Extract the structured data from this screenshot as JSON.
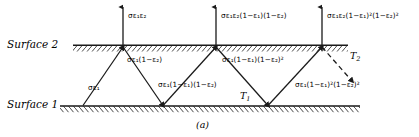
{
  "figure": {
    "caption": "(a)",
    "surfaces": [
      {
        "name": "Surface 2",
        "temperature": "T",
        "temperature_sub": "2"
      },
      {
        "name": "Surface 1",
        "temperature": "T",
        "temperature_sub": "1"
      }
    ]
  },
  "emitted_rays": [
    {
      "id": "emitted-1",
      "prefix": "σε",
      "s1": "1",
      "mid": "ε",
      "s2": "2",
      "tail": ""
    },
    {
      "id": "emitted-2",
      "prefix": "σε",
      "s1": "1",
      "mid": "ε",
      "s2": "2",
      "tail": "(1−ε₁)(1−ε₂)"
    },
    {
      "id": "emitted-3",
      "prefix": "σε",
      "s1": "1",
      "mid": "ε",
      "s2": "2",
      "tail": "(1−ε₁)²(1−ε₂)²"
    }
  ],
  "labels": {
    "top_1": "σε₁ε₂",
    "top_2": "σε₁ε₂(1−ε₁)(1−ε₂)",
    "top_3": "σε₁ε₂(1−ε₁)²(1−ε₂)²",
    "mid_1": "σε₁(1−ε₂)",
    "mid_2": "σε₁(1−ε₁)(1−ε₂)²",
    "low_1": "σε₁",
    "low_2": "σε₁(1−ε₁)(1−ε₂)",
    "low_3": "σε₁(1−ε₁)²(1−ε₂)²",
    "surface_2": "Surface 2",
    "surface_1": "Surface 1",
    "T2": "T",
    "T2_sub": "2",
    "T1": "T",
    "T1_sub": "1",
    "caption": "(a)"
  },
  "style": {
    "ink": "#1a1a1a",
    "background": "#ffffff"
  }
}
